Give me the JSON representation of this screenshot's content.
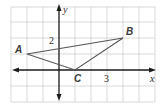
{
  "figure": {
    "type": "coordinate-plane-triangle",
    "grid": {
      "unit_px": 16,
      "origin_px": [
        59,
        70
      ],
      "x_range": [
        -3,
        6
      ],
      "y_range": [
        -2,
        4
      ]
    },
    "axes": {
      "x_label": "x",
      "y_label": "y"
    },
    "tick_labels": [
      {
        "axis": "y",
        "value": 2,
        "text": "2"
      },
      {
        "axis": "x",
        "value": 3,
        "text": "3"
      }
    ],
    "points": [
      {
        "name": "A",
        "x": -2,
        "y": 1
      },
      {
        "name": "B",
        "x": 4,
        "y": 2
      },
      {
        "name": "C",
        "x": 1,
        "y": 0
      }
    ],
    "colors": {
      "grid": "#c8c8c8",
      "axis": "#1a1a1a",
      "triangle": "#555555",
      "label": "#3a3a3a"
    }
  }
}
